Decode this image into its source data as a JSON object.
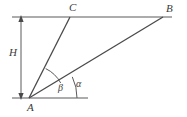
{
  "figure": {
    "kind": "geometry-diagram",
    "background_color": "#ffffff",
    "line_color": "#5a5a5a",
    "label_color": "#3a3a3a",
    "points": {
      "A": {
        "label": "A",
        "x": 29,
        "y": 98,
        "label_x": 27,
        "label_y": 108
      },
      "B": {
        "label": "B",
        "x": 163,
        "y": 17,
        "label_x": 166,
        "label_y": 9
      },
      "C": {
        "label": "C",
        "x": 70,
        "y": 17,
        "label_x": 69,
        "label_y": 8
      }
    },
    "dimension": {
      "label": "H",
      "label_x": 15,
      "label_y": 53,
      "arrow_x": 21,
      "arrow_top_y": 17,
      "arrow_bottom_y": 98
    },
    "angles": [
      {
        "label": "β",
        "name": "beta",
        "vertex": "A",
        "radius": 34,
        "label_x": 61,
        "label_y": 89
      },
      {
        "label": "α",
        "name": "alpha",
        "vertex": "A",
        "radius": 48,
        "label_x": 79,
        "label_y": 85
      }
    ],
    "segments": [
      {
        "name": "top-horizontal-line",
        "x1": 12,
        "y1": 17,
        "x2": 172,
        "y2": 17
      },
      {
        "name": "bottom-horizontal-line",
        "x1": 12,
        "y1": 98,
        "x2": 88,
        "y2": 98
      },
      {
        "name": "segment-AC",
        "x1": 29,
        "y1": 98,
        "x2": 70,
        "y2": 17
      },
      {
        "name": "segment-AB",
        "x1": 29,
        "y1": 98,
        "x2": 163,
        "y2": 17
      }
    ]
  }
}
